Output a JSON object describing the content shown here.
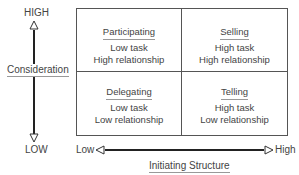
{
  "y_axis": {
    "label": "Consideration",
    "high": "HIGH",
    "low": "LOW"
  },
  "x_axis": {
    "label": "Initiating Structure",
    "low": "Low",
    "high": "High"
  },
  "quadrants": {
    "top_left": {
      "title": "Participating",
      "line1": "Low task",
      "line2": "High relationship"
    },
    "top_right": {
      "title": "Selling",
      "line1": "High task",
      "line2": "High relationship"
    },
    "bottom_left": {
      "title": "Delegating",
      "line1": "Low task",
      "line2": "Low relationship"
    },
    "bottom_right": {
      "title": "Telling",
      "line1": "High task",
      "line2": "Low relationship"
    }
  },
  "colors": {
    "line": "#333333",
    "text": "#444444"
  }
}
